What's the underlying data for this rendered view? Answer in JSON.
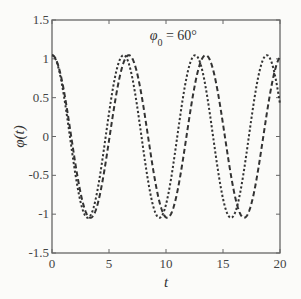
{
  "chart_data": {
    "type": "line",
    "title": "",
    "annotation": {
      "text_symbol": "φ",
      "text_subscript": "0",
      "text_rest": " = 60°",
      "x": 10.5,
      "y": 1.3
    },
    "xlabel": "t",
    "ylabel": "φ(t)",
    "xlim": [
      0,
      20
    ],
    "ylim": [
      -1.5,
      1.5
    ],
    "xticks": [
      0,
      5,
      10,
      15,
      20
    ],
    "xtick_labels": [
      "0",
      "5",
      "10",
      "15",
      "20"
    ],
    "yticks": [
      -1.5,
      -1,
      -0.5,
      0,
      0.5,
      1,
      1.5
    ],
    "ytick_labels": [
      "-1.5",
      "-1",
      "-0.5",
      "0",
      "0.5",
      "1",
      "1.5"
    ],
    "grid": false,
    "legend": null,
    "series": [
      {
        "name": "dotted curve",
        "line_style": "dotted",
        "color": "#333333",
        "amplitude": 1.047,
        "period": 6.28,
        "x": [
          0,
          1,
          2,
          3,
          3.14,
          4,
          5,
          6,
          6.28,
          7,
          8,
          9,
          9.42,
          10,
          11,
          12,
          12.57,
          13,
          14,
          15,
          15.71,
          16,
          17,
          18,
          18.85,
          19,
          20
        ],
        "y": [
          1.047,
          0.566,
          -0.436,
          -1.037,
          -1.047,
          -0.684,
          0.297,
          1.005,
          1.047,
          0.789,
          -0.152,
          -0.954,
          -1.047,
          -0.879,
          0.005,
          0.883,
          1.047,
          0.95,
          0.143,
          -0.795,
          -1.047,
          -1.0,
          -0.289,
          0.69,
          1.047,
          1.035,
          0.427
        ]
      },
      {
        "name": "dashed curve",
        "line_style": "dashed",
        "color": "#333333",
        "amplitude": 1.047,
        "period": 6.74,
        "x": [
          0,
          1,
          2,
          3,
          3.37,
          4,
          5,
          6,
          6.74,
          7,
          8,
          9,
          10,
          10.11,
          11,
          12,
          13,
          13.48,
          14,
          15,
          16,
          16.85,
          17,
          18,
          19,
          20
        ],
        "y": [
          1.047,
          0.63,
          -0.302,
          -0.968,
          -1.047,
          -0.836,
          -0.01,
          0.803,
          1.047,
          1.004,
          0.306,
          -0.617,
          -1.046,
          -1.047,
          -0.806,
          0.015,
          0.847,
          1.047,
          0.962,
          0.272,
          -0.642,
          -1.047,
          -1.035,
          -0.541,
          0.362,
          0.996
        ]
      }
    ]
  }
}
